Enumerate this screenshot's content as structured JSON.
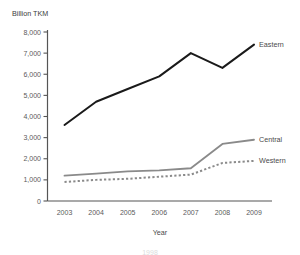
{
  "chart_data": {
    "type": "line",
    "title": "",
    "ylabel": "Billion TKM",
    "xlabel": "Year",
    "categories": [
      "2003",
      "2004",
      "2005",
      "2006",
      "2007",
      "2008",
      "2009"
    ],
    "x": [
      2003,
      2004,
      2005,
      2006,
      2007,
      2008,
      2009
    ],
    "ylim": [
      0,
      8000
    ],
    "ytick_labels": [
      "0",
      "1,000",
      "2,000",
      "3,000",
      "4,000",
      "5,000",
      "6,000",
      "7,000",
      "8,000"
    ],
    "ytick_values": [
      0,
      1000,
      2000,
      3000,
      4000,
      5000,
      6000,
      7000,
      8000
    ],
    "grid": false,
    "legend_position": "right-inline",
    "series": [
      {
        "name": "Eastern",
        "style": "solid",
        "color": "#1a1a1a",
        "values": [
          3600,
          4700,
          5300,
          5900,
          7000,
          6300,
          7400
        ]
      },
      {
        "name": "Central",
        "style": "solid",
        "color": "#8a8a8a",
        "values": [
          1200,
          1300,
          1400,
          1450,
          1550,
          2700,
          2900
        ]
      },
      {
        "name": "Western",
        "style": "dotted",
        "color": "#8a8a8a",
        "values": [
          900,
          1000,
          1050,
          1150,
          1250,
          1800,
          1900
        ]
      }
    ]
  },
  "caption": {
    "text": "1998"
  },
  "colors": {
    "axis": "#555555",
    "eastern": "#1a1a1a",
    "central": "#8a8a8a",
    "western": "#8a8a8a",
    "text": "#4a4a4a"
  }
}
